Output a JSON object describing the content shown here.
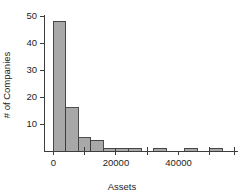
{
  "chart_data": {
    "type": "bar",
    "title": "",
    "subtitle": "",
    "xlabel": "Assets",
    "ylabel": "# of Companies",
    "grid": false,
    "legend": null,
    "xlim": [
      -3000,
      59000
    ],
    "ylim": [
      0,
      50
    ],
    "bin_width": 4000,
    "xticks": [
      0,
      20000,
      40000
    ],
    "xtick_labels": [
      "0",
      "20000",
      "40000"
    ],
    "xminor_ticks": [
      10000,
      30000,
      50000,
      58000
    ],
    "yticks": [
      10,
      20,
      30,
      40,
      50
    ],
    "ytick_labels": [
      "10",
      "20",
      "30",
      "40",
      "50"
    ],
    "bins": [
      {
        "x0": 0,
        "x1": 4000,
        "count": 48
      },
      {
        "x0": 4000,
        "x1": 8000,
        "count": 16
      },
      {
        "x0": 8000,
        "x1": 12000,
        "count": 5
      },
      {
        "x0": 12000,
        "x1": 16000,
        "count": 4
      },
      {
        "x0": 16000,
        "x1": 20000,
        "count": 1
      },
      {
        "x0": 20000,
        "x1": 24000,
        "count": 1
      },
      {
        "x0": 24000,
        "x1": 28000,
        "count": 1
      },
      {
        "x0": 32000,
        "x1": 36000,
        "count": 1
      },
      {
        "x0": 42000,
        "x1": 46000,
        "count": 1
      },
      {
        "x0": 50000,
        "x1": 54000,
        "count": 1
      }
    ],
    "categories": [
      "0-4000",
      "4000-8000",
      "8000-12000",
      "12000-16000",
      "16000-20000",
      "20000-24000",
      "24000-28000",
      "32000-36000",
      "42000-46000",
      "50000-54000"
    ],
    "values": [
      48,
      16,
      5,
      4,
      1,
      1,
      1,
      1,
      1,
      1
    ],
    "colors": {
      "bar_fill": "#a8a8a8",
      "bar_stroke": "#3b3b3b",
      "axis": "#3d3d3d",
      "text": "#1c1c1c",
      "background": "#ffffff"
    }
  }
}
